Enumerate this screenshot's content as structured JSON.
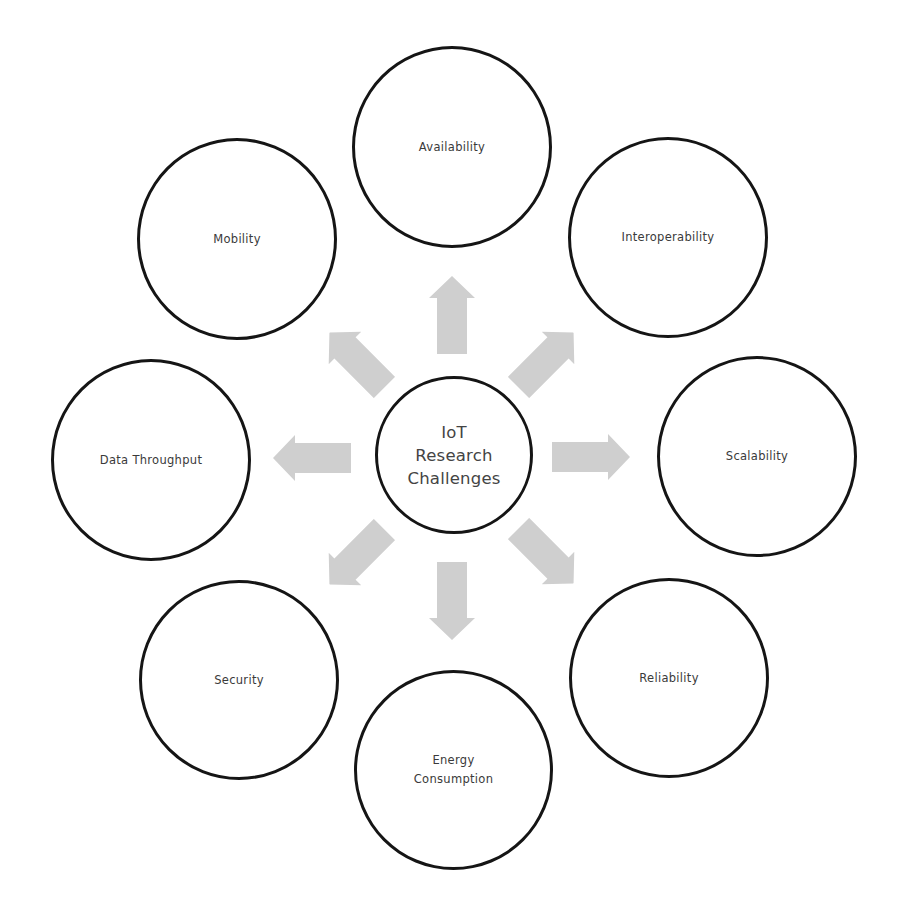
{
  "diagram": {
    "title": "IoT Research Challenges",
    "colors": {
      "circle_border": "#151515",
      "text": "#3a3a3a",
      "arrow_fill": "#cfcfcf",
      "background": "#ffffff"
    },
    "center": {
      "label": "IoT\nResearch\nChallenges"
    },
    "nodes": [
      {
        "id": "availability",
        "label": "Availability",
        "direction": "up"
      },
      {
        "id": "interoperability",
        "label": "Interoperability",
        "direction": "up-right"
      },
      {
        "id": "scalability",
        "label": "Scalability",
        "direction": "right"
      },
      {
        "id": "reliability",
        "label": "Reliability",
        "direction": "down-right"
      },
      {
        "id": "energy-consumption",
        "label": "Energy\nConsumption",
        "direction": "down"
      },
      {
        "id": "security",
        "label": "Security",
        "direction": "down-left"
      },
      {
        "id": "data-throughput",
        "label": "Data Throughput",
        "direction": "left"
      },
      {
        "id": "mobility",
        "label": "Mobility",
        "direction": "up-left"
      }
    ]
  }
}
